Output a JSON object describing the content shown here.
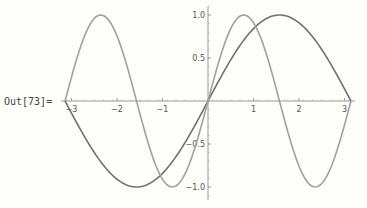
{
  "cell": {
    "label": "Out[73]="
  },
  "chart_data": {
    "type": "line",
    "title": "",
    "xlabel": "",
    "ylabel": "",
    "xlim": [
      -3.14159,
      3.14159
    ],
    "ylim": [
      -1.0,
      1.0
    ],
    "grid": false,
    "legend": null,
    "x_ticks": [
      "-3",
      "-2",
      "-1",
      "1",
      "2",
      "3"
    ],
    "y_ticks": [
      "1.0",
      "0.5",
      "-0.5",
      "-1.0"
    ],
    "series": [
      {
        "name": "sin(x)",
        "color": "#707070",
        "x": [
          -3.1416,
          -2.3562,
          -1.5708,
          -0.7854,
          0,
          0.7854,
          1.5708,
          2.3562,
          3.1416
        ],
        "values": [
          0,
          -0.707,
          -1,
          -0.707,
          0,
          0.707,
          1,
          0.707,
          0
        ]
      },
      {
        "name": "sin(2x)",
        "color": "#a0a0a0",
        "x": [
          -3.1416,
          -2.3562,
          -1.5708,
          -0.7854,
          0,
          0.7854,
          1.5708,
          2.3562,
          3.1416
        ],
        "values": [
          0,
          1,
          0,
          -1,
          0,
          1,
          0,
          -1,
          0
        ]
      }
    ]
  }
}
